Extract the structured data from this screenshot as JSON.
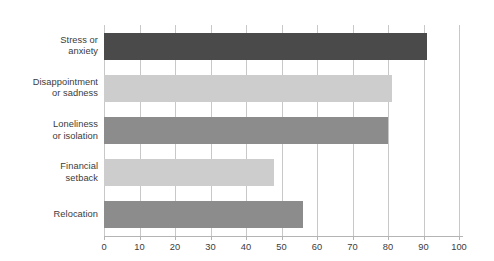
{
  "chart_data": {
    "type": "bar",
    "orientation": "horizontal",
    "title": "",
    "subtitle": "",
    "xlabel": "",
    "ylabel": "",
    "xlim": [
      0,
      100
    ],
    "xticks": [
      "0",
      "10",
      "20",
      "30",
      "40",
      "50",
      "60",
      "70",
      "80",
      "90",
      "100"
    ],
    "xtick_values": [
      0,
      10,
      20,
      30,
      40,
      50,
      60,
      70,
      80,
      90,
      100
    ],
    "grid": "vertical",
    "legend": "none",
    "categories": [
      "Stress or\nanxiety",
      "Disappointment\nor sadness",
      "Loneliness\nor isolation",
      "Financial\nsetback",
      "Relocation"
    ],
    "values": [
      91,
      81,
      80,
      48,
      56
    ],
    "bar_colors": [
      "#4a4a4a",
      "#cdcdcd",
      "#8c8c8c",
      "#cdcdcd",
      "#8c8c8c"
    ],
    "bars": [
      {
        "label": "Stress or\nanxiety",
        "value": 91,
        "color": "#4a4a4a"
      },
      {
        "label": "Disappointment\nor sadness",
        "value": 81,
        "color": "#cdcdcd"
      },
      {
        "label": "Loneliness\nor isolation",
        "value": 80,
        "color": "#8c8c8c"
      },
      {
        "label": "Financial\nsetback",
        "value": 48,
        "color": "#cdcdcd"
      },
      {
        "label": "Relocation",
        "value": 56,
        "color": "#8c8c8c"
      }
    ]
  },
  "style": {
    "background": "#ffffff",
    "gridline_color": "#c8c8c8",
    "axis_color": "#b4b4b4",
    "text_color": "#3b3b3b"
  }
}
